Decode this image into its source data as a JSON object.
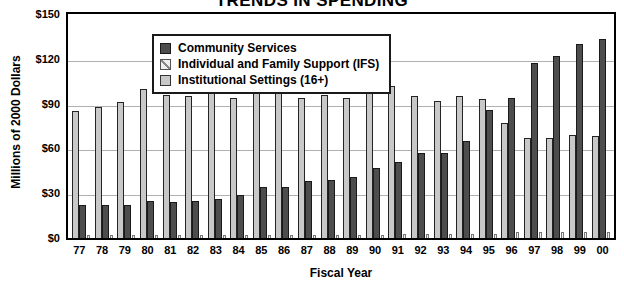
{
  "chart_data": {
    "type": "bar",
    "title": "TRENDS IN SPENDING",
    "xlabel": "Fiscal Year",
    "ylabel": "Millions of 2000 Dollars",
    "ylim": [
      0,
      150
    ],
    "yticks": [
      150,
      120,
      90,
      60,
      30,
      0
    ],
    "ytick_labels": [
      "$150",
      "$120",
      "$90",
      "$60",
      "$30",
      "$0"
    ],
    "grid": true,
    "legend_position": "top-left-inside",
    "categories": [
      "77",
      "78",
      "79",
      "80",
      "81",
      "82",
      "83",
      "84",
      "85",
      "86",
      "87",
      "88",
      "89",
      "90",
      "91",
      "92",
      "93",
      "94",
      "95",
      "96",
      "97",
      "98",
      "99",
      "00"
    ],
    "series": [
      {
        "name": "Community Services",
        "color": "#4d4d4d",
        "values": [
          22,
          22,
          22,
          25,
          24,
          25,
          26,
          29,
          34,
          34,
          38,
          39,
          41,
          47,
          51,
          57,
          57,
          65,
          86,
          94,
          117,
          122,
          130,
          133
        ]
      },
      {
        "name": "Individual and Family Support (IFS)",
        "color": "#efefef",
        "values": [
          1,
          1,
          1,
          1,
          1,
          1,
          1,
          1,
          2,
          2,
          2,
          2,
          2,
          2,
          3,
          3,
          3,
          3,
          3,
          4,
          4,
          4,
          4,
          4
        ]
      },
      {
        "name": "Institutional Settings (16+)",
        "color": "#c8c8c8",
        "values": [
          85,
          88,
          91,
          100,
          96,
          95,
          97,
          94,
          98,
          101,
          94,
          96,
          94,
          99,
          102,
          95,
          92,
          95,
          93,
          77,
          67,
          67,
          69,
          68
        ]
      }
    ]
  },
  "legend": {
    "items": [
      {
        "label": "Community Services",
        "swatch": "community-swatch"
      },
      {
        "label": "Individual and Family Support (IFS)",
        "swatch": "ifs-swatch"
      },
      {
        "label": "Institutional Settings (16+)",
        "swatch": "institutional-swatch"
      }
    ]
  }
}
